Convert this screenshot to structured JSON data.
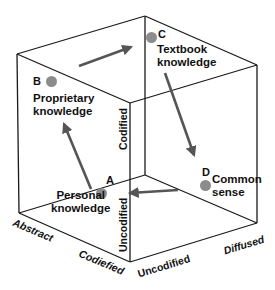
{
  "diagram": {
    "type": "knowledge-cube",
    "colors": {
      "edge": "#1a1a1a",
      "arrow": "#555555",
      "dot": "#8c8c8c",
      "text": "#111111"
    },
    "points": [
      {
        "id": "A",
        "label_line1": "Personal",
        "label_line2": "knowledge"
      },
      {
        "id": "B",
        "label_line1": "Proprietary",
        "label_line2": "knowledge"
      },
      {
        "id": "C",
        "label_line1": "Textbook",
        "label_line2": "knowledge"
      },
      {
        "id": "D",
        "label_line1": "Common",
        "label_line2": "sense"
      }
    ],
    "axes": {
      "abstract": "Abstract",
      "codified_bottom": "Codiefied",
      "uncodified_bottom": "Uncodified",
      "diffused": "Diffused",
      "codified_vertical": "Codified",
      "uncodified_vertical": "Uncodified"
    },
    "arrows": [
      {
        "from": "A",
        "to": "B"
      },
      {
        "from": "B",
        "to": "C"
      },
      {
        "from": "C",
        "to": "D"
      },
      {
        "from": "D",
        "to": "A"
      }
    ]
  }
}
